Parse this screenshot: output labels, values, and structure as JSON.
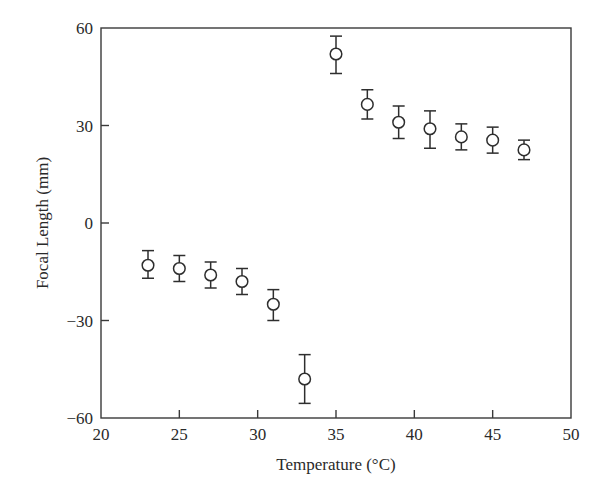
{
  "chart_data": {
    "type": "scatter",
    "title": "",
    "xlabel": "Temperature (°C)",
    "ylabel": "Focal Length (mm)",
    "xlim": [
      20,
      50
    ],
    "ylim": [
      -60,
      60
    ],
    "xticks": [
      20,
      25,
      30,
      35,
      40,
      45,
      50
    ],
    "yticks": [
      -60,
      -30,
      0,
      30,
      60
    ],
    "xtick_labels": [
      "20",
      "25",
      "30",
      "35",
      "40",
      "45",
      "50"
    ],
    "ytick_labels": [
      "−60",
      "−30",
      "0",
      "30",
      "60"
    ],
    "grid": false,
    "legend": null,
    "marker": "open-circle",
    "error_bars": true,
    "series": [
      {
        "name": "Focal length",
        "x": [
          23,
          25,
          27,
          29,
          31,
          33,
          35,
          37,
          39,
          41,
          43,
          45,
          47
        ],
        "y": [
          -13,
          -14,
          -16,
          -18,
          -25,
          -48,
          52,
          36.5,
          31,
          29,
          26.5,
          25.5,
          22.5
        ],
        "err_low": [
          4,
          4,
          4,
          4,
          5,
          7.5,
          6,
          4.5,
          5,
          6,
          4,
          4,
          3
        ],
        "err_high": [
          4.5,
          4,
          4,
          4,
          4.5,
          7.5,
          5.5,
          4.5,
          5,
          5.5,
          4,
          4,
          3
        ]
      }
    ]
  },
  "plot_area": {
    "left": 101,
    "right": 571,
    "top": 28,
    "bottom": 418
  }
}
